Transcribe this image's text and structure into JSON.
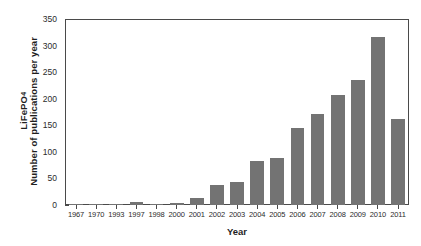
{
  "chart_data": {
    "type": "bar",
    "title": "",
    "subtitle": "",
    "xlabel": "Year",
    "ylabel_line1": "LiFePO",
    "ylabel_line1_sub": "4",
    "ylabel_line2": "Number of publications per year",
    "ylabel_full": "LiFePO4 Number of publications per year",
    "categories": [
      "1967",
      "1970",
      "1993",
      "1997",
      "1998",
      "2000",
      "2001",
      "2002",
      "2003",
      "2004",
      "2005",
      "2006",
      "2007",
      "2008",
      "2009",
      "2010",
      "2011"
    ],
    "values": [
      1,
      1,
      1,
      5,
      1,
      4,
      13,
      37,
      43,
      84,
      89,
      145,
      172,
      208,
      237,
      318,
      162
    ],
    "bar_color": "#737373",
    "axis_color": "#4a4a4a",
    "ylim": [
      0,
      350
    ],
    "yticks": [
      0,
      50,
      100,
      150,
      200,
      250,
      300,
      350
    ],
    "ytick_labels": [
      "0",
      "50",
      "100",
      "150",
      "200",
      "250",
      "300",
      "350"
    ],
    "grid": false,
    "legend": null,
    "legend_position": "none",
    "annotations": []
  }
}
